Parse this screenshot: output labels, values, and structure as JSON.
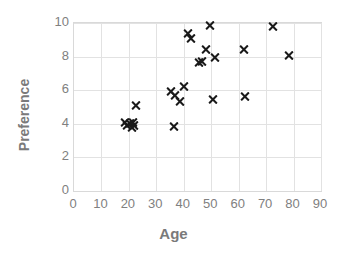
{
  "chart_data": {
    "type": "scatter",
    "title": "",
    "xlabel": "Age",
    "ylabel": "Preference",
    "xlim": [
      0,
      90
    ],
    "ylim": [
      0,
      10
    ],
    "xticks": [
      "0",
      "10",
      "20",
      "30",
      "40",
      "50",
      "60",
      "70",
      "80",
      "90"
    ],
    "yticks": [
      "0",
      "2",
      "4",
      "6",
      "8",
      "10"
    ],
    "grid": true,
    "legend": "none",
    "marker": "x",
    "marker_color": "#1a1a1a",
    "axis_color": "#d9d9d9",
    "grid_color": "#e2e2e2",
    "label_color": "#808080",
    "title_color": "#7a7a7a",
    "series": [
      {
        "name": "Age vs Preference",
        "points": [
          [
            18.5,
            4.1
          ],
          [
            19.5,
            3.9
          ],
          [
            20.5,
            4.0
          ],
          [
            21.0,
            3.8
          ],
          [
            21.5,
            4.1
          ],
          [
            22.0,
            3.9
          ],
          [
            22.5,
            5.1
          ],
          [
            36.5,
            3.85
          ],
          [
            35.5,
            5.9
          ],
          [
            37.0,
            5.7
          ],
          [
            38.5,
            5.35
          ],
          [
            40.0,
            6.2
          ],
          [
            41.5,
            9.35
          ],
          [
            42.5,
            9.1
          ],
          [
            45.5,
            7.65
          ],
          [
            46.5,
            7.7
          ],
          [
            48.0,
            8.45
          ],
          [
            49.5,
            9.85
          ],
          [
            51.5,
            7.95
          ],
          [
            50.5,
            5.45
          ],
          [
            62.5,
            5.6
          ],
          [
            62.0,
            8.45
          ],
          [
            72.5,
            9.8
          ],
          [
            78.5,
            8.05
          ]
        ]
      }
    ]
  }
}
